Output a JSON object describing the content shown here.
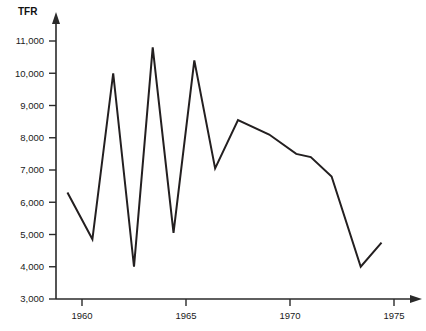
{
  "chart_data": {
    "type": "line",
    "title": "",
    "subtitle": "",
    "xlabel": "",
    "ylabel": "TFR",
    "ylabel_position": "top-left-above-axis",
    "grid": false,
    "legend": false,
    "axis_arrows": true,
    "xlim": [
      1958.4,
      1976.6
    ],
    "ylim": [
      3000,
      11400
    ],
    "xticks": [
      1960,
      1970,
      1975,
      1965
    ],
    "xtick_labels": [
      "1960",
      "1965",
      "1970",
      "1975"
    ],
    "xtick_values": [
      1960,
      1965,
      1970,
      1975
    ],
    "yticks": [
      3000,
      4000,
      5000,
      6000,
      7000,
      8000,
      9000,
      10000,
      11000
    ],
    "ytick_labels": [
      "3,000",
      "4,000",
      "5,000",
      "6,000",
      "7,000",
      "8,000",
      "9,000",
      "10,000",
      "11,000"
    ],
    "series": [
      {
        "name": "TFR",
        "color": "#231f20",
        "x": [
          1959.3,
          1960.5,
          1961.5,
          1962.5,
          1963.4,
          1964.4,
          1965.4,
          1966.4,
          1967.5,
          1969.0,
          1970.3,
          1971.0,
          1972.0,
          1973.4,
          1974.4
        ],
        "values": [
          6300,
          4850,
          10000,
          4000,
          10800,
          5050,
          10400,
          7050,
          8550,
          8100,
          7500,
          7400,
          6800,
          4000,
          4750
        ]
      }
    ]
  },
  "axis": {
    "y_title": "TFR"
  }
}
